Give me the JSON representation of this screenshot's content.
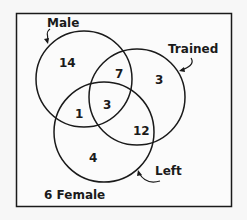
{
  "diagram": {
    "type": "venn",
    "sets": [
      {
        "id": "male",
        "label": "Male",
        "cx": 84,
        "cy": 79,
        "r": 48
      },
      {
        "id": "trained",
        "label": "Trained",
        "cx": 137,
        "cy": 97,
        "r": 48
      },
      {
        "id": "left",
        "label": "Left",
        "cx": 104,
        "cy": 132,
        "r": 50
      }
    ],
    "regions": [
      {
        "sets": [
          "male"
        ],
        "value": "14"
      },
      {
        "sets": [
          "male",
          "trained"
        ],
        "value": "7"
      },
      {
        "sets": [
          "trained"
        ],
        "value": "3"
      },
      {
        "sets": [
          "male",
          "left"
        ],
        "value": "1"
      },
      {
        "sets": [
          "male",
          "trained",
          "left"
        ],
        "value": "3"
      },
      {
        "sets": [
          "trained",
          "left"
        ],
        "value": "12"
      },
      {
        "sets": [
          "left"
        ],
        "value": "4"
      }
    ],
    "outside_label": "6 Female",
    "colors": {
      "background": "#f7f7f7",
      "stroke": "#1a1a1a"
    }
  }
}
